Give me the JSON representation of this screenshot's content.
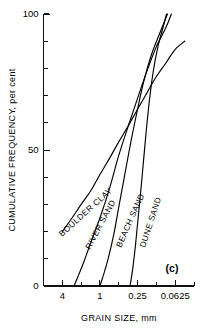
{
  "figure": {
    "panel_label": "(c)",
    "background_color": "#ffffff",
    "line_color": "#000000"
  },
  "chart_data": {
    "type": "line",
    "title": "",
    "subtitle": "",
    "xlabel": "GRAIN SIZE, mm",
    "ylabel": "CUMULATIVE FREQUENCY, per cent",
    "x_scale": "log-reversed",
    "x_tick_labels": [
      "4",
      "1",
      "0.25",
      "0.0625"
    ],
    "x_tick_values": [
      4,
      1,
      0.25,
      0.0625
    ],
    "x_minor_ticks_per_interval": 2,
    "xlim": [
      8,
      0.03125
    ],
    "y_tick_labels": [
      "0",
      "50",
      "100"
    ],
    "y_tick_values": [
      0,
      50,
      100
    ],
    "y_minor_tick_step": 10,
    "ylim": [
      0,
      100
    ],
    "grid": false,
    "legend": "inline-curve-labels",
    "series": [
      {
        "name": "BOULDER CLAY",
        "label": "BOULDER CLAY",
        "label_rotation_deg": -42,
        "points": [
          {
            "x": 4.0,
            "y": 20
          },
          {
            "x": 2.8,
            "y": 25
          },
          {
            "x": 2.0,
            "y": 30
          },
          {
            "x": 1.4,
            "y": 35
          },
          {
            "x": 1.0,
            "y": 41
          },
          {
            "x": 0.7,
            "y": 47
          },
          {
            "x": 0.5,
            "y": 53
          },
          {
            "x": 0.35,
            "y": 59
          },
          {
            "x": 0.25,
            "y": 65
          },
          {
            "x": 0.177,
            "y": 71
          },
          {
            "x": 0.125,
            "y": 77
          },
          {
            "x": 0.088,
            "y": 82
          },
          {
            "x": 0.0625,
            "y": 87
          },
          {
            "x": 0.044,
            "y": 90
          }
        ]
      },
      {
        "name": "RIVER SAND",
        "label": "RIVER SAND",
        "label_rotation_deg": -62,
        "points": [
          {
            "x": 2.6,
            "y": 0
          },
          {
            "x": 2.2,
            "y": 4
          },
          {
            "x": 1.8,
            "y": 9
          },
          {
            "x": 1.4,
            "y": 16
          },
          {
            "x": 1.0,
            "y": 25
          },
          {
            "x": 0.7,
            "y": 36
          },
          {
            "x": 0.5,
            "y": 48
          },
          {
            "x": 0.35,
            "y": 59
          },
          {
            "x": 0.25,
            "y": 69
          },
          {
            "x": 0.177,
            "y": 79
          },
          {
            "x": 0.125,
            "y": 88
          },
          {
            "x": 0.088,
            "y": 95
          },
          {
            "x": 0.072,
            "y": 100
          }
        ]
      },
      {
        "name": "BEACH SAND",
        "label": "BEACH SAND",
        "label_rotation_deg": -66,
        "points": [
          {
            "x": 1.0,
            "y": 0
          },
          {
            "x": 0.88,
            "y": 4
          },
          {
            "x": 0.74,
            "y": 10
          },
          {
            "x": 0.6,
            "y": 19
          },
          {
            "x": 0.5,
            "y": 29
          },
          {
            "x": 0.4,
            "y": 41
          },
          {
            "x": 0.32,
            "y": 53
          },
          {
            "x": 0.25,
            "y": 65
          },
          {
            "x": 0.2,
            "y": 75
          },
          {
            "x": 0.15,
            "y": 85
          },
          {
            "x": 0.11,
            "y": 93
          },
          {
            "x": 0.083,
            "y": 100
          }
        ]
      },
      {
        "name": "DUNE SAND",
        "label": "DUNE SAND",
        "label_rotation_deg": -72,
        "points": [
          {
            "x": 0.33,
            "y": 0
          },
          {
            "x": 0.3,
            "y": 6
          },
          {
            "x": 0.27,
            "y": 15
          },
          {
            "x": 0.24,
            "y": 27
          },
          {
            "x": 0.21,
            "y": 41
          },
          {
            "x": 0.185,
            "y": 55
          },
          {
            "x": 0.162,
            "y": 68
          },
          {
            "x": 0.14,
            "y": 79
          },
          {
            "x": 0.118,
            "y": 88
          },
          {
            "x": 0.098,
            "y": 95
          },
          {
            "x": 0.086,
            "y": 100
          }
        ]
      }
    ]
  }
}
